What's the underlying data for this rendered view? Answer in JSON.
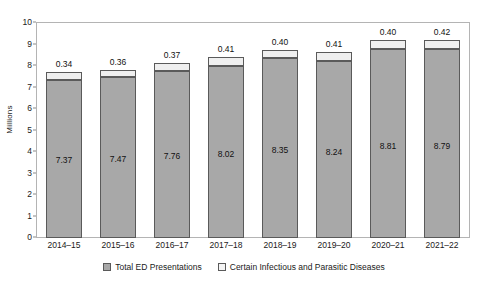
{
  "chart_data": {
    "type": "bar",
    "subtype": "stacked",
    "title": "",
    "xlabel": "",
    "ylabel": "Millions",
    "ylim": [
      0,
      10
    ],
    "ytick_step": 1,
    "yticks": [
      "10",
      "9",
      "8",
      "7",
      "6",
      "5",
      "4",
      "3",
      "2",
      "1",
      "0"
    ],
    "grid": false,
    "legend_position": "bottom",
    "categories": [
      "2014–15",
      "2015–16",
      "2016–17",
      "2017–18",
      "2018–19",
      "2019–20",
      "2020–21",
      "2021–22"
    ],
    "series": [
      {
        "name": "Total ED Presentations",
        "color": "#a8a8a8",
        "values": [
          7.37,
          7.47,
          7.76,
          8.02,
          8.35,
          8.24,
          8.81,
          8.79
        ],
        "labels": [
          "7.37",
          "7.47",
          "7.76",
          "8.02",
          "8.35",
          "8.24",
          "8.81",
          "8.79"
        ]
      },
      {
        "name": "Certain Infectious and Parasitic Diseases",
        "color": "#efefef",
        "values": [
          0.34,
          0.36,
          0.37,
          0.41,
          0.4,
          0.41,
          0.4,
          0.42
        ],
        "labels": [
          "0.34",
          "0.36",
          "0.37",
          "0.41",
          "0.40",
          "0.41",
          "0.40",
          "0.42"
        ]
      }
    ]
  },
  "axis": {
    "y_title": "Millions"
  },
  "legend": {
    "items": [
      {
        "label": "Total ED Presentations",
        "swatch": "total"
      },
      {
        "label": "Certain Infectious and Parasitic Diseases",
        "swatch": "infectious"
      }
    ]
  }
}
